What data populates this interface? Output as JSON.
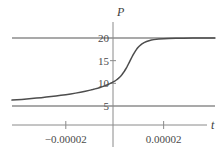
{
  "chart_data": {
    "type": "line",
    "title": "",
    "xlabel": "t",
    "ylabel": "P",
    "xlim": [
      -4.2e-05,
      4.1e-05
    ],
    "ylim": [
      2.0,
      22.5
    ],
    "grid": false,
    "legend": null,
    "axis_labels": {
      "x": "t",
      "y": "P"
    },
    "y_ticks": [
      {
        "value": 20,
        "label": "20"
      },
      {
        "value": 15,
        "label": "15"
      },
      {
        "value": 10,
        "label": "10"
      },
      {
        "value": 5,
        "label": "5"
      }
    ],
    "x_ticks": [
      {
        "value": -2e-05,
        "label": "−0.00002"
      },
      {
        "value": 2e-05,
        "label": "0.00002"
      }
    ],
    "series": [
      {
        "name": "logistic-curve",
        "type": "line",
        "color": "#4d4d4d",
        "points": [
          [
            -4.2e-05,
            6.3
          ],
          [
            -4e-05,
            6.38
          ],
          [
            -3.8e-05,
            6.46
          ],
          [
            -3.6e-05,
            6.55
          ],
          [
            -3.4e-05,
            6.64
          ],
          [
            -3.2e-05,
            6.74
          ],
          [
            -3e-05,
            6.84
          ],
          [
            -2.8e-05,
            6.96
          ],
          [
            -2.6e-05,
            7.08
          ],
          [
            -2.4e-05,
            7.21
          ],
          [
            -2.2e-05,
            7.35
          ],
          [
            -2e-05,
            7.5
          ],
          [
            -1.8e-05,
            7.66
          ],
          [
            -1.6e-05,
            7.84
          ],
          [
            -1.4e-05,
            8.04
          ],
          [
            -1.2e-05,
            8.26
          ],
          [
            -1e-05,
            8.5
          ],
          [
            -9e-06,
            8.63
          ],
          [
            -8e-06,
            8.78
          ],
          [
            -7e-06,
            8.93
          ],
          [
            -6e-06,
            9.1
          ],
          [
            -5e-06,
            9.28
          ],
          [
            -4e-06,
            9.48
          ],
          [
            -3e-06,
            9.7
          ],
          [
            -2e-06,
            9.94
          ],
          [
            -1e-06,
            10.2
          ],
          [
            0.0,
            10.5
          ],
          [
            5e-07,
            10.68
          ],
          [
            1e-06,
            10.88
          ],
          [
            1.5e-06,
            11.1
          ],
          [
            2e-06,
            11.35
          ],
          [
            2.5e-06,
            11.64
          ],
          [
            3e-06,
            11.96
          ],
          [
            3.5e-06,
            12.32
          ],
          [
            4e-06,
            12.72
          ],
          [
            4.5e-06,
            13.16
          ],
          [
            5e-06,
            13.64
          ],
          [
            5.5e-06,
            14.15
          ],
          [
            6e-06,
            14.68
          ],
          [
            6.5e-06,
            15.22
          ],
          [
            7e-06,
            15.75
          ],
          [
            7.5e-06,
            16.26
          ],
          [
            8e-06,
            16.74
          ],
          [
            8.5e-06,
            17.17
          ],
          [
            9e-06,
            17.56
          ],
          [
            9.5e-06,
            17.9
          ],
          [
            1e-05,
            18.19
          ],
          [
            1.1e-05,
            18.65
          ],
          [
            1.2e-05,
            18.99
          ],
          [
            1.3e-05,
            19.23
          ],
          [
            1.4e-05,
            19.41
          ],
          [
            1.5e-05,
            19.54
          ],
          [
            1.6e-05,
            19.64
          ],
          [
            1.8e-05,
            19.77
          ],
          [
            2e-05,
            19.85
          ],
          [
            2.2e-05,
            19.9
          ],
          [
            2.5e-05,
            19.94
          ],
          [
            2.8e-05,
            19.96
          ],
          [
            3.2e-05,
            19.98
          ],
          [
            3.6e-05,
            19.99
          ],
          [
            4.1e-05,
            20.0
          ]
        ]
      },
      {
        "name": "upper-asymptote",
        "type": "horizontal-line",
        "value": 20,
        "color": "#555555"
      },
      {
        "name": "lower-asymptote",
        "type": "horizontal-line",
        "value": 5,
        "color": "#555555"
      }
    ]
  }
}
